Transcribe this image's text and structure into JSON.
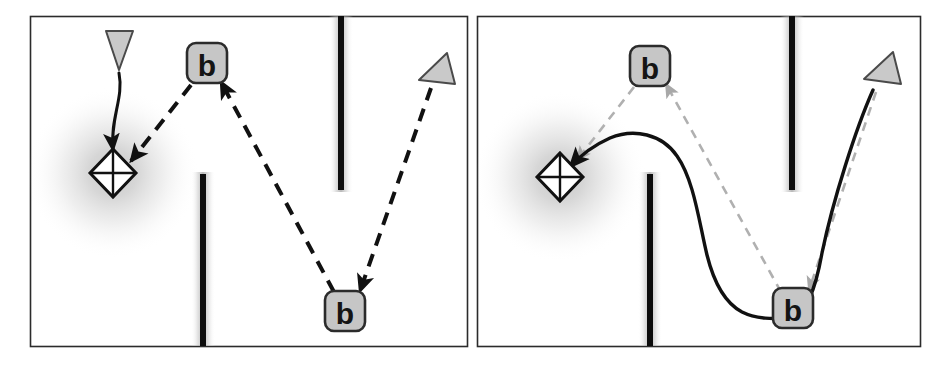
{
  "figure": {
    "type": "diagram",
    "panel_count": 2,
    "canvas": {
      "width": 943,
      "height": 369
    },
    "colors": {
      "background": "#ffffff",
      "panel_border": "#2b2b2b",
      "obstacle": "#0d0d0d",
      "obstacle_halo": "#b9b9b9",
      "goal_halo": "#bdbdbd",
      "node_fill": "#c6c6c6",
      "node_border": "#2b2b2b",
      "node_text": "#141414",
      "agent_fill": "#c9c9c9",
      "agent_border": "#3a3a3a",
      "solid_path": "#111111",
      "dashed_path_dark": "#111111",
      "dashed_path_light": "#b0b0b0",
      "goal_fill": "#ffffff",
      "goal_border": "#111111"
    },
    "panels": [
      {
        "id": "panel-left",
        "name": "left-panel",
        "frame": {
          "x": 30,
          "y": 16,
          "width": 437,
          "height": 330
        },
        "goal": {
          "name": "goal-marker",
          "shape": "diamond-with-cross",
          "cx": 113,
          "cy": 173,
          "rx": 22,
          "ry": 24,
          "halo_radius": 82
        },
        "obstacles": [
          {
            "name": "obstacle-upper-right",
            "x": 341,
            "y_top": 16,
            "y_bottom": 190,
            "thickness": 6
          },
          {
            "name": "obstacle-lower-middle",
            "x": 203,
            "y_top": 172,
            "y_bottom": 346,
            "thickness": 6
          }
        ],
        "agents": [
          {
            "name": "agent-triangle-down",
            "cx": 119,
            "cy": 49,
            "orientation": "down",
            "size": 22
          },
          {
            "name": "agent-triangle-tilted",
            "cx": 437,
            "cy": 70,
            "orientation": "up-right",
            "size": 22
          }
        ],
        "nodes": [
          {
            "name": "waypoint-node-upper",
            "label": "b",
            "cx": 207,
            "cy": 63,
            "width": 40,
            "height": 40
          },
          {
            "name": "waypoint-node-lower",
            "label": "b",
            "cx": 345,
            "cy": 311,
            "width": 40,
            "height": 40
          }
        ],
        "paths": [
          {
            "name": "solid-path-agent-to-goal",
            "style": "solid",
            "color": "#111111",
            "width": 3,
            "arrowhead": "large",
            "d": "M 119,72 C 122,100 112,120 115,150"
          },
          {
            "name": "dashed-path-upper-node-to-goal",
            "style": "dashed",
            "color": "#111111",
            "width": 4,
            "arrowhead": "medium",
            "d": "M 190,84 L 129,161"
          },
          {
            "name": "dashed-path-lower-node-to-upper-node",
            "style": "dashed",
            "color": "#111111",
            "width": 4,
            "arrowhead": "medium",
            "d": "M 333,292 L 220,80"
          },
          {
            "name": "dashed-path-agent-to-lower-node",
            "style": "dashed",
            "color": "#111111",
            "width": 4,
            "arrowhead": "medium",
            "d": "M 432,85 L 360,292"
          }
        ]
      },
      {
        "id": "panel-right",
        "name": "right-panel",
        "frame": {
          "x": 477,
          "y": 16,
          "width": 443,
          "height": 330
        },
        "goal": {
          "name": "goal-marker",
          "shape": "diamond-with-cross",
          "cx": 560,
          "cy": 173,
          "rx": 22,
          "ry": 24,
          "halo_radius": 82
        },
        "obstacles": [
          {
            "name": "obstacle-upper-right",
            "x": 792,
            "y_top": 16,
            "y_bottom": 190,
            "thickness": 6
          },
          {
            "name": "obstacle-lower-middle",
            "x": 650,
            "y_top": 172,
            "y_bottom": 346,
            "thickness": 6
          }
        ],
        "agents": [
          {
            "name": "agent-triangle-tilted",
            "cx": 882,
            "cy": 70,
            "orientation": "up-right",
            "size": 22
          }
        ],
        "nodes": [
          {
            "name": "waypoint-node-upper",
            "label": "b",
            "cx": 650,
            "cy": 66,
            "width": 40,
            "height": 40
          },
          {
            "name": "waypoint-node-lower",
            "label": "b",
            "cx": 793,
            "cy": 308,
            "width": 40,
            "height": 40
          }
        ],
        "paths": [
          {
            "name": "solid-trajectory-agent-to-goal",
            "style": "solid",
            "color": "#111111",
            "width": 3.5,
            "arrowhead": "large",
            "d": "M 872,89 C 840,140 812,250 795,300 C 780,340 740,330 725,300 C 700,250 690,160 660,137 C 630,115 600,140 578,165"
          },
          {
            "name": "dashed-path-upper-node-to-goal",
            "style": "dashed",
            "color": "#b0b0b0",
            "width": 2.5,
            "arrowhead": "small",
            "d": "M 635,87 L 576,161"
          },
          {
            "name": "dashed-path-lower-node-to-upper-node",
            "style": "dashed",
            "color": "#b0b0b0",
            "width": 2.5,
            "arrowhead": "small",
            "d": "M 780,290 L 667,82"
          },
          {
            "name": "dashed-path-agent-to-lower-node",
            "style": "dashed",
            "color": "#b0b0b0",
            "width": 2.5,
            "arrowhead": "small",
            "d": "M 876,90 L 808,290"
          }
        ]
      }
    ]
  }
}
